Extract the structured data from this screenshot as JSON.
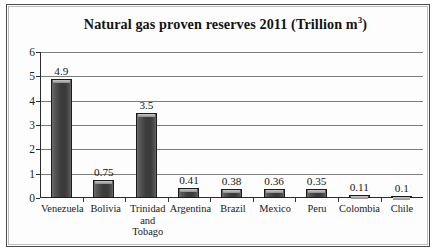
{
  "chart_data": {
    "type": "bar",
    "title": "Natural gas proven reserves 2011 (Trillion m",
    "title_superscript": "3",
    "title_suffix": ")",
    "title_full": "Natural gas proven reserves 2011 (Trillion m3)",
    "xlabel": "",
    "ylabel": "",
    "ylim": [
      0,
      6
    ],
    "yticks": [
      0,
      1,
      2,
      3,
      4,
      5,
      6
    ],
    "ytick_labels": [
      "0",
      "1",
      "2",
      "3",
      "4",
      "5",
      "6"
    ],
    "grid": "horizontal",
    "legend": "none",
    "categories": [
      "Venezuela",
      "Bolivia",
      "Trinidad and Tobago",
      "Argentina",
      "Brazil",
      "Mexico",
      "Peru",
      "Colombia",
      "Chile"
    ],
    "category_labels": [
      [
        "Venezuela"
      ],
      [
        "Bolivia"
      ],
      [
        "Trinidad",
        "and Tobago"
      ],
      [
        "Argentina"
      ],
      [
        "Brazil"
      ],
      [
        "Mexico"
      ],
      [
        "Peru"
      ],
      [
        "Colombia"
      ],
      [
        "Chile"
      ]
    ],
    "values": [
      4.9,
      0.75,
      3.5,
      0.41,
      0.38,
      0.36,
      0.35,
      0.11,
      0.1
    ],
    "value_labels": [
      "4.9",
      "0.75",
      "3.5",
      "0.41",
      "0.38",
      "0.36",
      "0.35",
      "0.11",
      "0.1"
    ],
    "series": [
      {
        "name": "Proven reserves",
        "values": [
          4.9,
          0.75,
          3.5,
          0.41,
          0.38,
          0.36,
          0.35,
          0.11,
          0.1
        ]
      }
    ],
    "colors": {
      "bar_fill": "#3d3d3d",
      "bar_highlight": "#c9c9c9",
      "bar_border": "#1b1b1b",
      "gridline": "#7d7d7d",
      "axis": "#2b2b2b",
      "text": "#161616",
      "background": "#fdfdfd",
      "frame_border": "#4a4a4a"
    }
  }
}
